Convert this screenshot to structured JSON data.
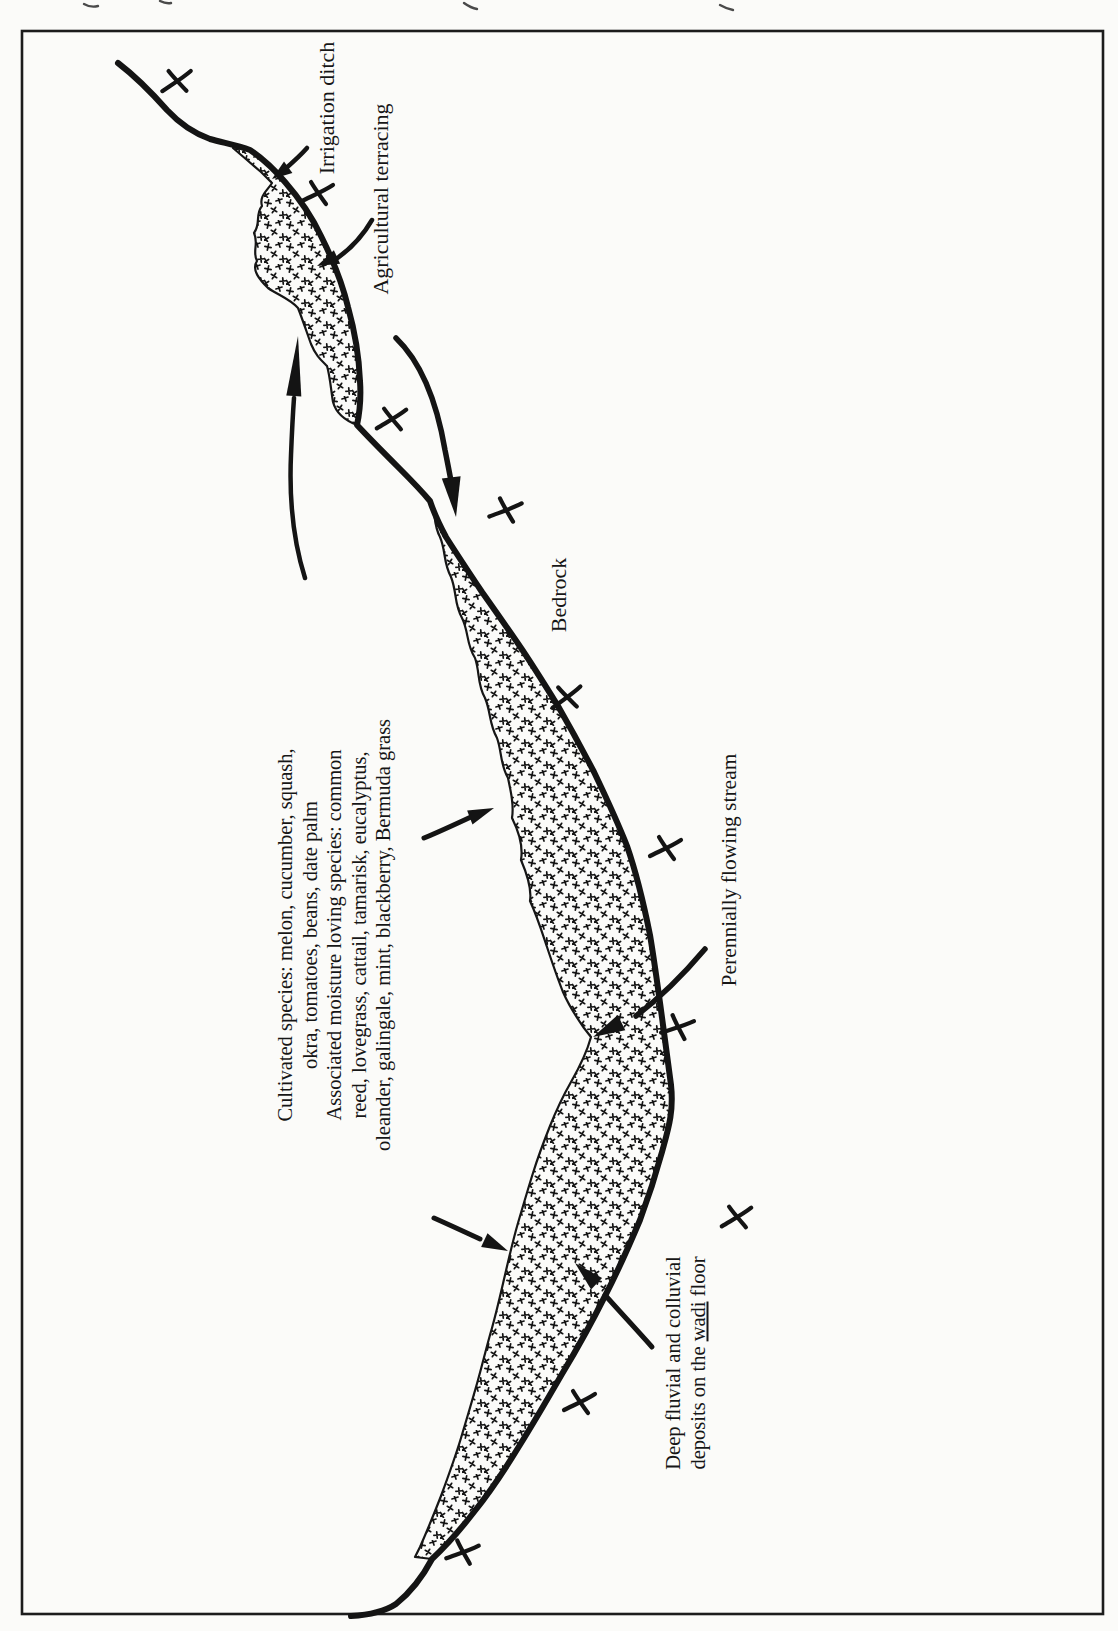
{
  "figure": {
    "kind": "wadi-oasis-plan-sketch",
    "paper_color": "#fbfbf9",
    "ink_color": "#161616",
    "labels": {
      "irrigation_ditch": "Irrigation ditch",
      "agricultural_terracing": "Agricultural terracing",
      "bedrock": "Bedrock",
      "perennial_stream": "Perennially flowing stream",
      "species_lines": [
        "Cultivated species: melon, cucumber, squash,",
        "okra, tomatoes, beans, date palm",
        "Associated moisture loving species: common",
        "reed, lovegrass, cattail, tamarisk, eucalyptus,",
        "oleander, galingale, mint, blackberry, Bermuda grass"
      ],
      "deposits_line1": "Deep fluvial and colluvial",
      "deposits_line2_pre": "deposits on the ",
      "deposits_word_underlined": "wadi",
      "deposits_line2_post": " floor"
    },
    "symbols": {
      "bedrock_mark": "x-cross-icon",
      "wadi_floor_fill": "stipple-cross-pattern"
    }
  }
}
